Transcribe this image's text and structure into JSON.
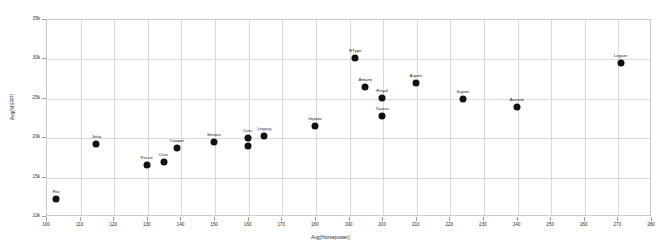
{
  "chart_data": {
    "type": "scatter",
    "title": "",
    "subtitle": "",
    "xlabel": "Avg(Horsepower)",
    "ylabel": "Avg(MSRP)",
    "xlim": [
      100,
      280
    ],
    "ylim": [
      10000,
      35000
    ],
    "xticks": [
      100,
      110,
      120,
      130,
      140,
      150,
      160,
      170,
      180,
      190,
      200,
      210,
      220,
      230,
      240,
      250,
      260,
      270,
      280
    ],
    "xticklabels": [
      "100",
      "110",
      "120",
      "130",
      "140",
      "150",
      "160",
      "170",
      "180",
      "190",
      "200",
      "210",
      "220",
      "230",
      "240",
      "250",
      "260",
      "270",
      "280"
    ],
    "yticks": [
      10000,
      15000,
      20000,
      25000,
      30000,
      35000
    ],
    "yticklabels": [
      "10k",
      "15k",
      "20k",
      "25k",
      "30k",
      "35k"
    ],
    "grid": true,
    "legend": false,
    "marker_color": "#111111",
    "grid_color": "#d8d8d8",
    "axis_color": "#c9c9c9",
    "points": [
      {
        "label": "Rio",
        "x": 103,
        "y": 12200
      },
      {
        "label": "Jetta",
        "x": 115,
        "y": 19200
      },
      {
        "label": "Focus",
        "x": 130,
        "y": 16500
      },
      {
        "label": "Civic",
        "x": 135,
        "y": 16900
      },
      {
        "label": "Cooper",
        "x": 139,
        "y": 18600
      },
      {
        "label": "Stratus",
        "x": 150,
        "y": 19400
      },
      {
        "label": "Civic",
        "x": 160,
        "y": 19900
      },
      {
        "label": "",
        "x": 160,
        "y": 18900
      },
      {
        "label": "Legacy",
        "x": 165,
        "y": 20200
      },
      {
        "label": "Impala",
        "x": 180,
        "y": 21400
      },
      {
        "label": "RType",
        "x": 192,
        "y": 30000
      },
      {
        "label": "Amanti",
        "x": 195,
        "y": 26400
      },
      {
        "label": "Regal",
        "x": 200,
        "y": 25000
      },
      {
        "label": "Taurus",
        "x": 200,
        "y": 22700
      },
      {
        "label": "Aspen",
        "x": 210,
        "y": 26900
      },
      {
        "label": "Signet",
        "x": 224,
        "y": 24800
      },
      {
        "label": "Accord",
        "x": 240,
        "y": 23800
      },
      {
        "label": "Legser",
        "x": 271,
        "y": 29400
      }
    ]
  }
}
